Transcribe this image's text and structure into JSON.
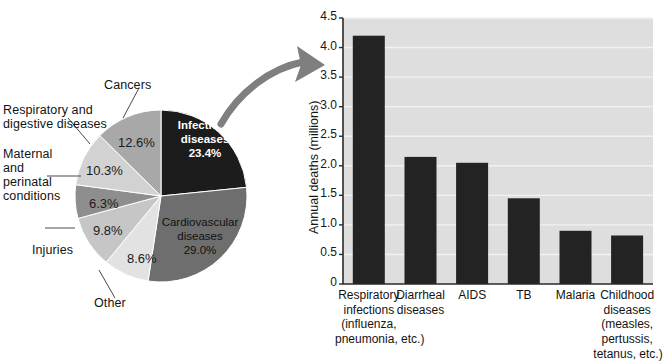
{
  "figure": {
    "title_fragment": "",
    "background": "#ffffff"
  },
  "pie": {
    "name": "causes-of-death-pie",
    "center": {
      "x": 161,
      "y": 196
    },
    "radius": 86,
    "slices": [
      {
        "label": "Infectious diseases",
        "percent_text": "23.4%",
        "value": 23.4,
        "color": "#1c1c1c",
        "text_color": "#ffffff",
        "inside_label": true
      },
      {
        "label": "Cardiovascular diseases",
        "percent_text": "29.0%",
        "value": 29.0,
        "color": "#6e6e6e",
        "text_color": "#111111",
        "inside_label": true
      },
      {
        "label": "Other",
        "percent_text": "8.6%",
        "value": 8.6,
        "color": "#e2e2e2",
        "text_color": "#1b1b1b",
        "inside_label": false
      },
      {
        "label": "Injuries",
        "percent_text": "9.8%",
        "value": 9.8,
        "color": "#c6c6c6",
        "text_color": "#1b1b1b",
        "inside_label": false
      },
      {
        "label": "Maternal and perinatal conditions",
        "percent_text": "6.3%",
        "value": 6.3,
        "color": "#8e8e8e",
        "text_color": "#1b1b1b",
        "inside_label": false
      },
      {
        "label": "Respiratory and digestive diseases",
        "percent_text": "10.3%",
        "value": 10.3,
        "color": "#d2d2d2",
        "text_color": "#1b1b1b",
        "inside_label": false
      },
      {
        "label": "Cancers",
        "percent_text": "12.6%",
        "value": 12.6,
        "color": "#a8a8a8",
        "text_color": "#1b1b1b",
        "inside_label": false
      }
    ],
    "callouts": {
      "cancers": "Cancers",
      "respiratory_digestive_l1": "Respiratory and",
      "respiratory_digestive_l2": "digestive diseases",
      "maternal_l1": "Maternal",
      "maternal_l2": "and",
      "maternal_l3": "perinatal",
      "maternal_l4": "conditions",
      "injuries": "Injuries",
      "other": "Other"
    },
    "inside_labels": {
      "infectious_l1": "Infectious",
      "infectious_l2": "diseases",
      "infectious_pct": "23.4%",
      "cardio_l1": "Cardiovascular",
      "cardio_l2": "diseases",
      "cardio_pct": "29.0%"
    },
    "outside_pcts": {
      "cancers": "12.6%",
      "respiratory": "10.3%",
      "maternal": "6.3%",
      "injuries": "9.8%",
      "other": "8.6%"
    }
  },
  "arrow": {
    "name": "pie-to-bar-arrow",
    "color": "#7f7f7f"
  },
  "chart_data": {
    "type": "bar",
    "title": "",
    "xlabel": "",
    "ylabel": "Annual deaths (millions)",
    "ylim": [
      0,
      4.5
    ],
    "ytick_labels": [
      "4.5",
      "4.0",
      "3.5",
      "3.0",
      "2.5",
      "2.0",
      "1.5",
      "1.0",
      "0.5",
      "0"
    ],
    "ytick_values": [
      4.5,
      4.0,
      3.5,
      3.0,
      2.5,
      2.0,
      1.5,
      1.0,
      0.5,
      0
    ],
    "grid": true,
    "legend": "none",
    "bar_color": "#232323",
    "plot_background": "#dedede",
    "categories": [
      "Respiratory infections (influenza, pneumonia, etc.)",
      "Diarrheal diseases",
      "AIDS",
      "TB",
      "Malaria",
      "Childhood diseases (measles, pertussis, tetanus, etc.)"
    ],
    "category_lines": [
      [
        "Respiratory",
        "infections",
        "(influenza,",
        "pneumonia, etc.)"
      ],
      [
        "Diarrheal",
        "diseases"
      ],
      [
        "AIDS"
      ],
      [
        "TB"
      ],
      [
        "Malaria"
      ],
      [
        "Childhood",
        "diseases",
        "(measles,",
        "pertussis,",
        "tetanus, etc.)"
      ]
    ],
    "values": [
      4.2,
      2.15,
      2.05,
      1.45,
      0.9,
      0.82
    ]
  }
}
